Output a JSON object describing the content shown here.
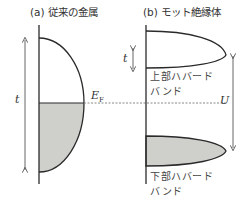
{
  "panel_a": {
    "title": "(a) 従来の金属",
    "hopping_label": "t",
    "fermi_label": "E",
    "fermi_subscript": "F"
  },
  "panel_b": {
    "title": "(b) モット絶縁体",
    "hopping_label": "t",
    "upper_band_line1": "上部ハバード",
    "upper_band_line2": "バンド",
    "lower_band_line1": "下部ハバード",
    "lower_band_line2": "バンド",
    "interaction_label": "U"
  },
  "colors": {
    "line": "#2a2a2a",
    "fill": "#cfd0cc",
    "arrow": "#555555",
    "dotted": "#888888"
  }
}
